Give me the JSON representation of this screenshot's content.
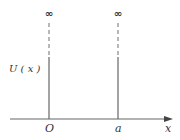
{
  "diagram": {
    "y_label": "U ( x )",
    "x_axis_label": "x",
    "origin_label": "O",
    "right_wall_label": "a",
    "left_wall_top_symbol": "∞",
    "right_wall_top_symbol": "∞",
    "colors": {
      "line": "#666666",
      "text": "#333333",
      "background": "#ffffff"
    }
  }
}
